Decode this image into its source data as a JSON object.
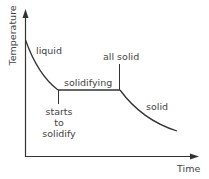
{
  "diagram": {
    "axes": {
      "x_label": "Time",
      "y_label": "Temperature"
    },
    "labels": {
      "liquid": "liquid",
      "solidifying": "solidifying",
      "all_solid": "all solid",
      "solid": "solid",
      "starts_to_solidify": [
        "starts",
        "to",
        "solidify"
      ]
    },
    "colors": {
      "line": "#333333",
      "text": "#444444",
      "background": "#ffffff"
    }
  }
}
